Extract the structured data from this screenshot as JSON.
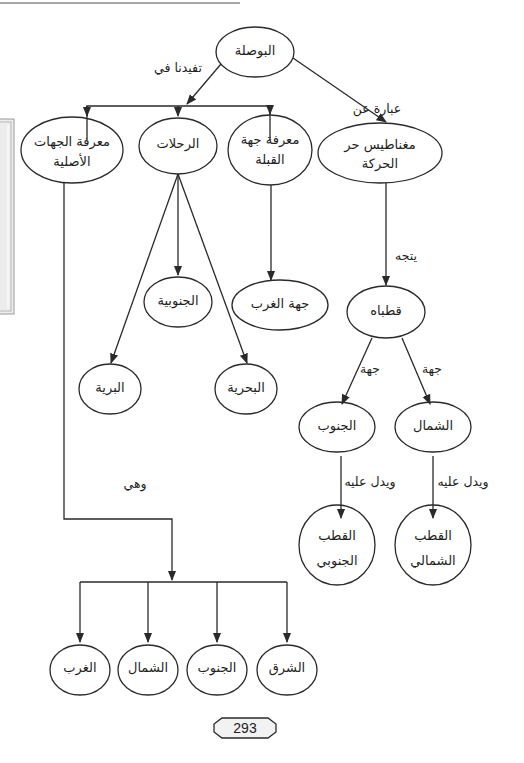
{
  "diagram": {
    "type": "concept-map",
    "root": {
      "id": "compass",
      "label": "البوصلة"
    },
    "nodes": [
      {
        "id": "compass",
        "label": "البوصلة",
        "cx": 255,
        "cy": 52
      },
      {
        "id": "know-cardinal",
        "label": "معرفة الجهات الأصلية",
        "line1": "معرفة الجهات",
        "line2": "الأصلية",
        "cx": 72,
        "cy": 150
      },
      {
        "id": "trips",
        "label": "الرحلات",
        "cx": 178,
        "cy": 146
      },
      {
        "id": "know-qibla",
        "label": "معرفة جهة القبلة",
        "line1": "معرفة جهة",
        "line2": "القبلة",
        "cx": 270,
        "cy": 150
      },
      {
        "id": "free-magnet",
        "label": "مغناطيس حر الحركة",
        "line1": "مغناطيس حر",
        "line2": "الحركة",
        "cx": 380,
        "cy": 153
      },
      {
        "id": "southern",
        "label": "الجنوبية",
        "cx": 178,
        "cy": 302
      },
      {
        "id": "west-direction",
        "label": "جهة الغرب",
        "cx": 280,
        "cy": 305
      },
      {
        "id": "land",
        "label": "البرية",
        "cx": 110,
        "cy": 388
      },
      {
        "id": "sea",
        "label": "البحرية",
        "cx": 246,
        "cy": 388
      },
      {
        "id": "its-poles",
        "label": "قطباه",
        "cx": 386,
        "cy": 312
      },
      {
        "id": "south",
        "label": "الجنوب",
        "cx": 337,
        "cy": 427
      },
      {
        "id": "north",
        "label": "الشمال",
        "cx": 433,
        "cy": 427
      },
      {
        "id": "south-pole",
        "label": "القطب الجنوبي",
        "line1": "القطب",
        "line2": "الجنوبي",
        "cx": 337,
        "cy": 545
      },
      {
        "id": "north-pole",
        "label": "القطب الشمالي",
        "line1": "القطب",
        "line2": "الشمالي",
        "cx": 433,
        "cy": 545
      },
      {
        "id": "east",
        "label": "الشرق",
        "cx": 287,
        "cy": 670
      },
      {
        "id": "south-2",
        "label": "الجنوب",
        "cx": 217,
        "cy": 670
      },
      {
        "id": "north-2",
        "label": "الشمال",
        "cx": 148,
        "cy": 670
      },
      {
        "id": "west",
        "label": "الغرب",
        "cx": 80,
        "cy": 670
      }
    ],
    "edges": [
      {
        "from": "compass",
        "to": [
          "know-cardinal",
          "trips",
          "know-qibla"
        ],
        "label": "تفيدنا في"
      },
      {
        "from": "compass",
        "to": "free-magnet",
        "label": "عبارة عن"
      },
      {
        "from": "trips",
        "to": [
          "southern",
          "land",
          "sea"
        ],
        "label": ""
      },
      {
        "from": "know-qibla",
        "to": "west-direction",
        "label": ""
      },
      {
        "from": "free-magnet",
        "to": "its-poles",
        "label": "يتجه"
      },
      {
        "from": "its-poles",
        "to": "south",
        "label": "جهة"
      },
      {
        "from": "its-poles",
        "to": "north",
        "label": "جهة"
      },
      {
        "from": "south",
        "to": "south-pole",
        "label": "ويدل عليه"
      },
      {
        "from": "north",
        "to": "north-pole",
        "label": "ويدل عليه"
      },
      {
        "from": "know-cardinal",
        "to": [
          "east",
          "south-2",
          "north-2",
          "west"
        ],
        "label": "وهي"
      }
    ]
  },
  "labels": {
    "compass": "البوصلة",
    "benefits_in": "تفيدنا في",
    "consists_of": "عبارة عن",
    "know_cardinal_1": "معرفة الجهات",
    "know_cardinal_2": "الأصلية",
    "trips": "الرحلات",
    "know_qibla_1": "معرفة جهة",
    "know_qibla_2": "القبلة",
    "free_magnet_1": "مغناطيس حر",
    "free_magnet_2": "الحركة",
    "points_to": "يتجه",
    "southern": "الجنوبية",
    "west_direction": "جهة الغرب",
    "land": "البرية",
    "sea": "البحرية",
    "its_poles": "قطباه",
    "direction_left": "جهة",
    "direction_right": "جهة",
    "south": "الجنوب",
    "north": "الشمال",
    "indicates_left": "ويدل عليه",
    "indicates_right": "ويدل عليه",
    "south_pole_1": "القطب",
    "south_pole_2": "الجنوبي",
    "north_pole_1": "القطب",
    "north_pole_2": "الشمالي",
    "and_they_are": "وهي",
    "east": "الشرق",
    "south_2": "الجنوب",
    "north_2": "الشمال",
    "west": "الغرب"
  },
  "page": {
    "number": "293"
  },
  "colors": {
    "stroke": "#2a2a2a",
    "page_badge_fill": "#f2f2f2",
    "edge_box": "#bdbdbd"
  }
}
